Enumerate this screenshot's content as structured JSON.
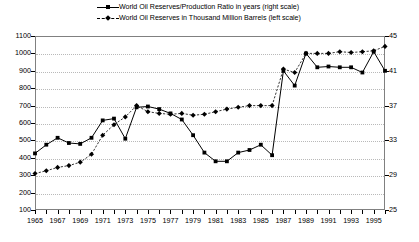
{
  "legend": {
    "position": "top-center",
    "entries": [
      {
        "label": "World Oil Reserves/Production Ratio in years (right scale)",
        "marker": "square-marker-icon",
        "line": "solid"
      },
      {
        "label": "World Oil Reserves in Thousand Million Barrels (left scale)",
        "marker": "diamond-marker-icon",
        "line": "dashed"
      }
    ]
  },
  "chart_data": {
    "type": "line",
    "title": "",
    "subtitle": "",
    "xlabel": "",
    "grid": true,
    "legend_position": "top-center",
    "x": [
      1965,
      1966,
      1967,
      1968,
      1969,
      1970,
      1971,
      1972,
      1973,
      1974,
      1975,
      1976,
      1977,
      1978,
      1979,
      1980,
      1981,
      1982,
      1983,
      1984,
      1985,
      1986,
      1987,
      1988,
      1989,
      1990,
      1991,
      1992,
      1993,
      1994,
      1995,
      1996
    ],
    "xticklabels": [
      "1965",
      "1967",
      "1969",
      "1971",
      "1973",
      "1975",
      "1977",
      "1979",
      "1981",
      "1983",
      "1985",
      "1987",
      "1989",
      "1991",
      "1993",
      "1995"
    ],
    "xlim": [
      1965,
      1996
    ],
    "left_axis": {
      "label": "World Oil Reserves in Thousand Million Barrels",
      "ylim": [
        100,
        1100
      ],
      "ticks": [
        100,
        200,
        300,
        400,
        500,
        600,
        700,
        800,
        900,
        1000,
        1100
      ]
    },
    "right_axis": {
      "label": "World Oil Reserves/Production Ratio in years",
      "ylim": [
        25,
        45
      ],
      "ticks": [
        25,
        29,
        33,
        37,
        41,
        45
      ]
    },
    "series": [
      {
        "name": "World Oil Reserves/Production Ratio in years (right scale)",
        "axis": "right",
        "line": "solid",
        "marker": "square",
        "values": [
          31.5,
          32.5,
          33.3,
          32.7,
          32.6,
          33.3,
          35.3,
          35.5,
          33.2,
          36.8,
          36.9,
          36.6,
          36.1,
          35.4,
          33.6,
          31.6,
          30.6,
          30.6,
          31.6,
          31.9,
          32.5,
          31.3,
          41.0,
          39.3,
          43.0,
          41.4,
          41.5,
          41.4,
          41.4,
          40.8,
          43.2,
          41.0
        ]
      },
      {
        "name": "World Oil Reserves in Thousand Million Barrels (left scale)",
        "axis": "left",
        "line": "dashed",
        "marker": "diamond",
        "values": [
          310,
          325,
          345,
          355,
          375,
          420,
          530,
          590,
          635,
          700,
          665,
          655,
          650,
          655,
          645,
          650,
          665,
          680,
          690,
          700,
          700,
          700,
          910,
          890,
          1000,
          1000,
          1000,
          1010,
          1005,
          1010,
          1015,
          1040
        ]
      }
    ]
  },
  "axes": {
    "left_ticks": [
      "1100",
      "1000",
      "900",
      "800",
      "700",
      "600",
      "500",
      "400",
      "300",
      "200",
      "100"
    ],
    "right_ticks": [
      "45",
      "41",
      "37",
      "33",
      "29",
      "25"
    ]
  }
}
